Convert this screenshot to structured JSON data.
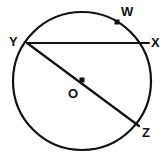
{
  "figure": {
    "kind": "circle-geometry-diagram",
    "background_color": "#ffffff",
    "stroke_color": "#111111",
    "label_color": "#111111",
    "circle": {
      "name": "circle-O",
      "center_x": 82,
      "center_y": 81,
      "radius": 69,
      "stroke_width": 2.2
    },
    "center_point": {
      "name": "center-point-O",
      "x": 82,
      "y": 80,
      "size": 5
    },
    "marked_point_w": {
      "name": "point-w-marker",
      "x": 117,
      "y": 22,
      "size": 5
    },
    "chord_yx": {
      "name": "chord-yx",
      "x1": 27,
      "y1": 43,
      "x2": 149,
      "y2": 43,
      "stroke_width": 2.0
    },
    "diameter_yz": {
      "name": "diameter-yz",
      "x1": 27,
      "y1": 43,
      "x2": 139,
      "y2": 126,
      "stroke_width": 2.2
    },
    "labels": [
      {
        "id": "label-w",
        "text": "W",
        "x": 121,
        "y": 5
      },
      {
        "id": "label-y",
        "text": "Y",
        "x": 9,
        "y": 35
      },
      {
        "id": "label-x",
        "text": "X",
        "x": 151,
        "y": 36
      },
      {
        "id": "label-o",
        "text": "O",
        "x": 68,
        "y": 87
      },
      {
        "id": "label-z",
        "text": "Z",
        "x": 142,
        "y": 126
      }
    ]
  }
}
